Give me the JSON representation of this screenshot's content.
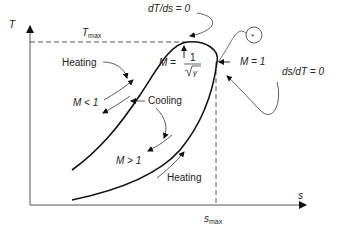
{
  "diagram": {
    "axes": {
      "y_label": "T",
      "x_label": "s"
    },
    "reference_lines": {
      "t_max": {
        "label_main": "T",
        "label_sub": "max"
      },
      "s_max": {
        "label_main": "s",
        "label_sub": "max"
      }
    },
    "annotations": {
      "dT_ds_zero": "dT/ds = 0",
      "ds_dT_zero": "ds/dT = 0",
      "m_equals_1": "M = 1",
      "m_less_1": "M < 1",
      "m_greater_1": "M > 1",
      "m_lhs": "M =",
      "m_frac_num": "1",
      "m_frac_den": "γ",
      "heating_upper": "Heating",
      "heating_lower": "Heating",
      "cooling": "Cooling",
      "star_symbol": "*"
    },
    "colors": {
      "curve": "#111111",
      "axis": "#555555",
      "dashed": "#444444",
      "text": "#222222"
    }
  }
}
